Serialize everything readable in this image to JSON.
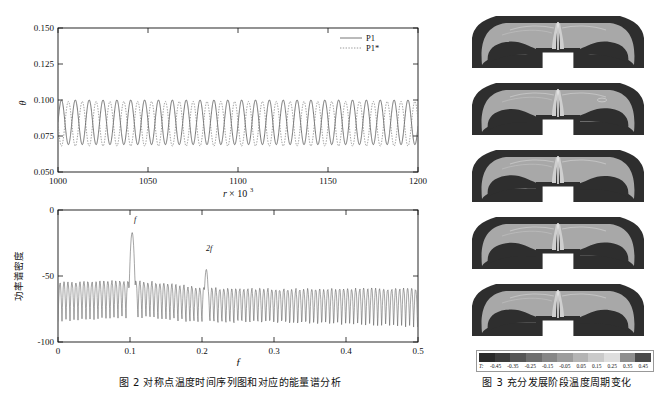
{
  "figure2": {
    "caption": "图 2   对称点温度时间序列图和对应的能量谱分析",
    "timeseries": {
      "ylabel": "θ",
      "xlabel_var": "r",
      "xlabel_mult": "× 10",
      "xlabel_exp": "3",
      "ytick_labels": [
        "0.050",
        "0.075",
        "0.100",
        "0.125",
        "0.150"
      ],
      "xtick_labels": [
        "1000",
        "1050",
        "1100",
        "1150",
        "1200"
      ],
      "legend": [
        {
          "label": "P1",
          "style": "solid"
        },
        {
          "label": "P1*",
          "style": "dotted"
        }
      ]
    },
    "psd": {
      "ylabel": "功率谱密度",
      "xlabel": "f",
      "ytick_labels": [
        "-100",
        "-50",
        "0"
      ],
      "xtick_labels": [
        "0",
        "0.1",
        "0.2",
        "0.3",
        "0.4",
        "0.5"
      ],
      "annotations": [
        {
          "label": "f",
          "x": 0.103,
          "y": -12
        },
        {
          "label": "2f",
          "x": 0.206,
          "y": -40
        }
      ]
    }
  },
  "figure3": {
    "caption": "图 3   充分发展阶段温度周期变化",
    "panel_count": 5,
    "colorbar": {
      "title": "T:",
      "ticks": [
        "-0.45",
        "-0.35",
        "-0.25",
        "-0.15",
        "-0.05",
        "0.05",
        "0.15",
        "0.25",
        "0.35",
        "0.45"
      ],
      "colors": [
        "#2a2a2a",
        "#3d3d3d",
        "#565656",
        "#6e6e6e",
        "#868686",
        "#9c9c9c",
        "#b4b4b4",
        "#cacaca",
        "#dedede",
        "#8e8e8e",
        "#4a4a4a"
      ]
    }
  },
  "chart_data": [
    {
      "type": "line",
      "title": "对称点温度时间序列图",
      "xlabel": "r × 10^3",
      "ylabel": "θ",
      "xlim": [
        1000,
        1200
      ],
      "ylim": [
        0.05,
        0.15
      ],
      "xticks": [
        1000,
        1050,
        1100,
        1150,
        1200
      ],
      "yticks": [
        0.05,
        0.075,
        0.1,
        0.125,
        0.15
      ],
      "grid": false,
      "legend_position": "top-right",
      "series": [
        {
          "name": "P1",
          "style": "solid",
          "description": "sinusoidal oscillation, mean 0.0845, amplitude 0.0155, period ~7.7 units",
          "mean": 0.0845,
          "amplitude": 0.0155,
          "period": 7.7,
          "phase": 0.0
        },
        {
          "name": "P1*",
          "style": "dotted",
          "description": "sinusoidal oscillation, mean 0.0835, amplitude 0.0155, period ~7.7 units, antiphase",
          "mean": 0.0835,
          "amplitude": 0.0155,
          "period": 7.7,
          "phase": 3.14159
        }
      ]
    },
    {
      "type": "line",
      "title": "能量谱分析",
      "xlabel": "f",
      "ylabel": "功率谱密度",
      "xlim": [
        0,
        0.5
      ],
      "ylim": [
        -100,
        0
      ],
      "xticks": [
        0,
        0.1,
        0.2,
        0.3,
        0.4,
        0.5
      ],
      "yticks": [
        -100,
        -50,
        0
      ],
      "grid": false,
      "peaks": [
        {
          "label": "f",
          "frequency": 0.103,
          "power": -17
        },
        {
          "label": "2f",
          "frequency": 0.206,
          "power": -45
        }
      ],
      "baseline_power": -62
    }
  ]
}
